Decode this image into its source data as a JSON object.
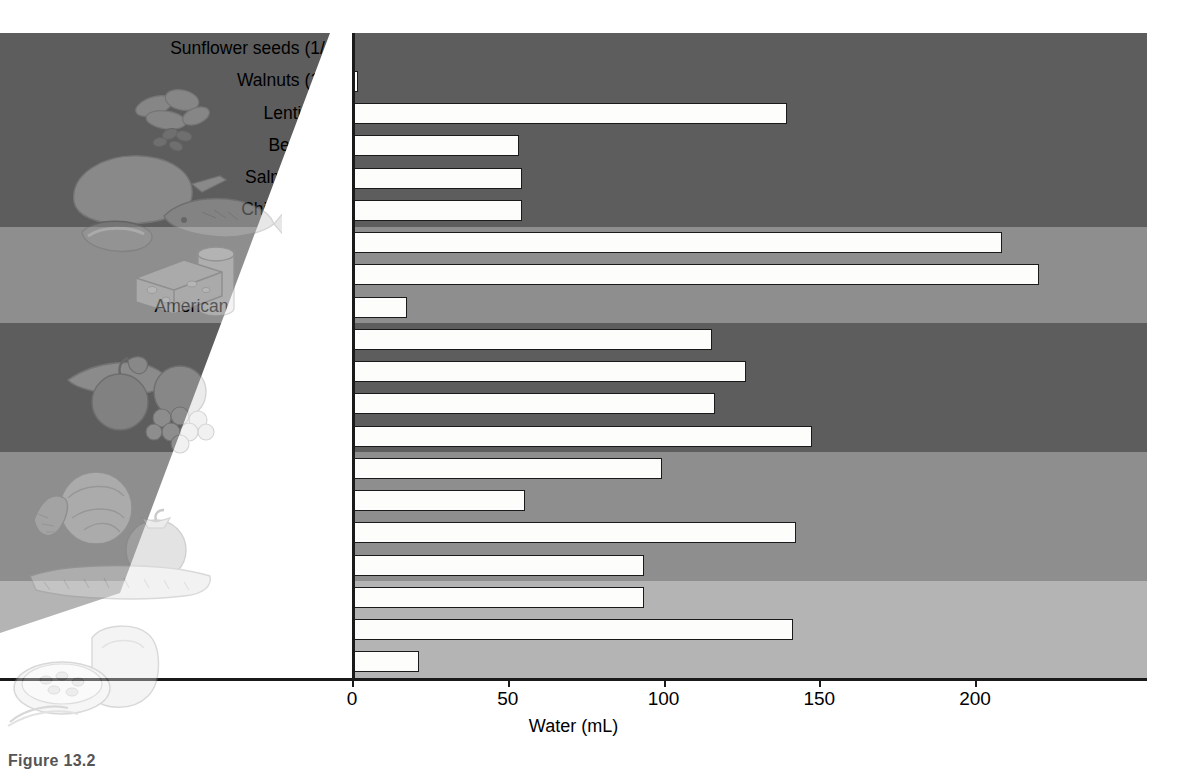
{
  "figure": {
    "caption": "Figure 13.2",
    "xlabel": "Water (mL)"
  },
  "axis": {
    "ticks": [
      "0",
      "50",
      "100",
      "150",
      "200"
    ]
  },
  "illustrations": [
    {
      "name": "nuts-and-seeds-illustration"
    },
    {
      "name": "meat-poultry-fish-illustration"
    },
    {
      "name": "dairy-cheese-milk-illustration"
    },
    {
      "name": "fruits-illustration"
    },
    {
      "name": "vegetables-illustration"
    },
    {
      "name": "grains-bread-cereal-illustration"
    }
  ],
  "chart_data": {
    "type": "bar",
    "orientation": "horizontal",
    "title": "",
    "xlabel": "Water (mL)",
    "ylabel": "",
    "xlim": [
      0,
      248
    ],
    "xticks": [
      0,
      50,
      100,
      150,
      200
    ],
    "grid": false,
    "legend": "none",
    "bar_style": {
      "fill": "#fdfdfb",
      "edge": "#1a1a1a"
    },
    "categories": [
      "Sunflower seeds (1/4 c)",
      "Walnuts (1/4 c)",
      "Lentils (1 c)",
      "Beef (3 oz)",
      "Salmon (3 oz)",
      "Chicken (3 oz)",
      "Yogurt (1 c)",
      "1% milk (1 c)",
      "American cheese (1.5 oz)",
      "Orange (1 med)",
      "Kiwi (2 med)",
      "Apple (1 med)",
      "Watermelon (1 c)",
      "Green beans (1 c)",
      "Corn on cob (1 med)",
      "Broccoli (1 c)",
      "Potato, baked (1 med)",
      "Spaghetti, cooked (1 c)",
      "White rice, cooked (1 c)",
      "White bread (2 sl)"
    ],
    "values": [
      0,
      1,
      139,
      53,
      54,
      54,
      208,
      220,
      17,
      115,
      126,
      116,
      147,
      99,
      55,
      142,
      93,
      93,
      141,
      21
    ],
    "groups": [
      {
        "name": "Nuts, seeds and legumes",
        "shade": "#5d5d5d",
        "rows": [
          0,
          1,
          2
        ]
      },
      {
        "name": "Meat, poultry and fish",
        "shade": "#5d5d5d",
        "rows": [
          3,
          4,
          5
        ]
      },
      {
        "name": "Milk and dairy",
        "shade": "#8e8e8e",
        "rows": [
          6,
          7,
          8
        ]
      },
      {
        "name": "Fruits",
        "shade": "#5d5d5d",
        "rows": [
          9,
          10,
          11,
          12
        ]
      },
      {
        "name": "Vegetables",
        "shade": "#8e8e8e",
        "rows": [
          13,
          14,
          15,
          16
        ]
      },
      {
        "name": "Grains",
        "shade": "#b4b4b4",
        "rows": [
          17,
          18,
          19
        ]
      }
    ]
  }
}
